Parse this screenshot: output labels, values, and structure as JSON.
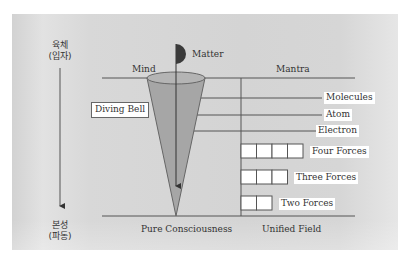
{
  "diagram": {
    "top_caption": "",
    "left_axis": {
      "top_label_line1": "육체",
      "top_label_line2": "(입자)",
      "bottom_label_line1": "본성",
      "bottom_label_line2": "(파동)"
    },
    "column_headers": {
      "left": "Mind",
      "right": "Mantra"
    },
    "matter_label": "Matter",
    "diving_bell_label": "Diving Bell",
    "levels": [
      {
        "name": "molecules",
        "label": "Molecules"
      },
      {
        "name": "atom",
        "label": "Atom"
      },
      {
        "name": "electron",
        "label": "Electron"
      }
    ],
    "forces": [
      {
        "name": "four-forces",
        "label": "Four Forces",
        "count": 4
      },
      {
        "name": "three-forces",
        "label": "Three Forces",
        "count": 3
      },
      {
        "name": "two-forces",
        "label": "Two Forces",
        "count": 2
      }
    ],
    "bottom_labels": {
      "left": "Pure Consciousness",
      "right": "Unified Field"
    },
    "colors": {
      "panel": "#d6d6d6",
      "line": "#555555",
      "cone_fill": "#a6a6a6",
      "matter_fill": "#3a3a3a"
    }
  }
}
